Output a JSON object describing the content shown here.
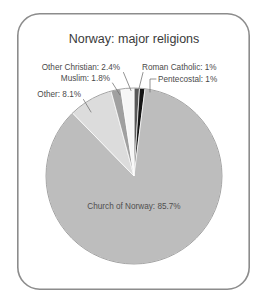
{
  "figure": {
    "width": 266,
    "height": 302,
    "background": "#ffffff",
    "frame": {
      "name": "rounded-border",
      "x": 17,
      "y": 13,
      "width": 233,
      "height": 277,
      "radius": 22,
      "stroke": "#8c8c8c"
    }
  },
  "chart_data": {
    "type": "pie",
    "title": "Norway: major religions",
    "xlabel": "",
    "ylabel": "",
    "units": "percent",
    "legend": "none",
    "grid": false,
    "start_angle_deg": 0,
    "direction": "clockwise",
    "center": {
      "x": 134,
      "y": 176
    },
    "radius": 88,
    "categories": [
      "Roman Catholic",
      "Pentecostal",
      "Church of Norway",
      "Other",
      "Muslim",
      "Other Christian"
    ],
    "values": [
      1,
      1,
      85.7,
      8.1,
      1.8,
      2.4
    ],
    "slices": [
      {
        "name": "Roman Catholic",
        "value": 1,
        "value_label": "1%",
        "label": "Roman Catholic: 1%",
        "color": "#585858",
        "start_deg": 0,
        "end_deg": 3.6
      },
      {
        "name": "Pentecostal",
        "value": 1,
        "value_label": "1%",
        "label": "Pentecostal: 1%",
        "color": "#151515",
        "start_deg": 3.6,
        "end_deg": 7.2
      },
      {
        "name": "Church of Norway",
        "value": 85.7,
        "value_label": "85.7%",
        "label": "Church of Norway: 85.7%",
        "color": "#bdbdbd",
        "start_deg": 7.2,
        "end_deg": 315.72
      },
      {
        "name": "Other",
        "value": 8.1,
        "value_label": "8.1%",
        "label": "Other: 8.1%",
        "color": "#dcdcdc",
        "start_deg": 315.72,
        "end_deg": 344.88
      },
      {
        "name": "Muslim",
        "value": 1.8,
        "value_label": "1.8%",
        "label": "Muslim: 1.8%",
        "color": "#a0a0a0",
        "start_deg": 344.88,
        "end_deg": 351.36
      },
      {
        "name": "Other Christian",
        "value": 2.4,
        "value_label": "2.4%",
        "label": "Other Christian: 2.4%",
        "color": "#f6f6f6",
        "start_deg": 351.36,
        "end_deg": 360
      }
    ]
  },
  "labels": {
    "other_christian": "Other Christian: 2.4%",
    "roman_catholic": "Roman Catholic: 1%",
    "muslim": "Muslim: 1.8%",
    "pentecostal": "Pentecostal: 1%",
    "other": "Other: 8.1%",
    "church_of_norway": "Church of Norway: 85.7%"
  }
}
